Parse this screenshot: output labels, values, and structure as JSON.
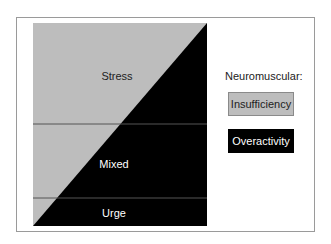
{
  "diagram": {
    "regions": [
      {
        "label": "Stress",
        "x": 117,
        "y": 76,
        "color": "#222222"
      },
      {
        "label": "Mixed",
        "x": 114,
        "y": 164,
        "color": "#ffffff"
      },
      {
        "label": "Urge",
        "x": 114,
        "y": 213,
        "color": "#ffffff"
      }
    ],
    "colors": {
      "insufficiency": "#bdbdbd",
      "overactivity": "#000000"
    }
  },
  "legend": {
    "title": "Neuromuscular:",
    "items": [
      {
        "label": "Insufficiency"
      },
      {
        "label": "Overactivity"
      }
    ]
  }
}
